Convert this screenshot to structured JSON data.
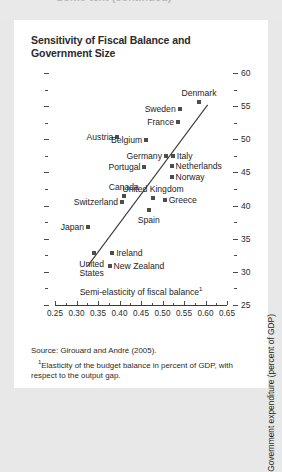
{
  "page": {
    "clipped_header_text": "Some text (continued)"
  },
  "figure": {
    "title": "Sensitivity of Fiscal Balance and Government Size",
    "source": "Source: Girouard and André (2005).",
    "footnote_marker": "1",
    "footnote": "Elasticity of the budget balance in percent of GDP, with respect to the output gap."
  },
  "chart_data": {
    "type": "scatter",
    "title": "Sensitivity of Fiscal Balance and Government Size",
    "xlabel": "Semi-elasticity of fiscal balance",
    "xlabel_footnote": "1",
    "ylabel": "Government expenditure (percent of GDP)",
    "xlim": [
      0.25,
      0.65
    ],
    "ylim": [
      25,
      60
    ],
    "xticks": [
      "0.25",
      "0.30",
      "0.35",
      "0.40",
      "0.45",
      "0.50",
      "0.55",
      "0.60",
      "0.65"
    ],
    "xtick_values": [
      0.25,
      0.3,
      0.35,
      0.4,
      0.45,
      0.5,
      0.55,
      0.6,
      0.65
    ],
    "yticks": [
      "25",
      "30",
      "35",
      "40",
      "45",
      "50",
      "55",
      "60"
    ],
    "ytick_values": [
      25,
      30,
      35,
      40,
      45,
      50,
      55,
      60
    ],
    "grid": false,
    "legend": null,
    "minor_ticks": true,
    "marker_color": "#4d4d4d",
    "trendline": {
      "label": "fitted line",
      "x0": 0.325,
      "y0": 30.8,
      "x1": 0.605,
      "y1": 55.2
    },
    "points": [
      {
        "label": "Denmark",
        "x": 0.585,
        "y": 55.6,
        "label_pos": "above"
      },
      {
        "label": "Sweden",
        "x": 0.54,
        "y": 54.6,
        "label_pos": "left"
      },
      {
        "label": "France",
        "x": 0.536,
        "y": 52.6,
        "label_pos": "left"
      },
      {
        "label": "Austria",
        "x": 0.395,
        "y": 50.3,
        "label_pos": "left"
      },
      {
        "label": "Belgium",
        "x": 0.462,
        "y": 49.9,
        "label_pos": "left"
      },
      {
        "label": "Germany",
        "x": 0.508,
        "y": 47.5,
        "label_pos": "left"
      },
      {
        "label": "Italy",
        "x": 0.524,
        "y": 47.5,
        "label_pos": "right"
      },
      {
        "label": "Netherlands",
        "x": 0.521,
        "y": 45.9,
        "label_pos": "right"
      },
      {
        "label": "Portugal",
        "x": 0.458,
        "y": 45.8,
        "label_pos": "left"
      },
      {
        "label": "Norway",
        "x": 0.521,
        "y": 44.3,
        "label_pos": "right"
      },
      {
        "label": "Canada",
        "x": 0.41,
        "y": 41.5,
        "label_pos": "above"
      },
      {
        "label": "United Kingdom",
        "x": 0.478,
        "y": 41.1,
        "label_pos": "above"
      },
      {
        "label": "Greece",
        "x": 0.505,
        "y": 40.9,
        "label_pos": "right"
      },
      {
        "label": "Switzerland",
        "x": 0.406,
        "y": 40.5,
        "label_pos": "left"
      },
      {
        "label": "Spain",
        "x": 0.468,
        "y": 39.4,
        "label_pos": "below"
      },
      {
        "label": "Japan",
        "x": 0.327,
        "y": 36.7,
        "label_pos": "left"
      },
      {
        "label": "United States",
        "x": 0.34,
        "y": 32.9,
        "label_pos": "two-line-below"
      },
      {
        "label": "Ireland",
        "x": 0.383,
        "y": 32.9,
        "label_pos": "right"
      },
      {
        "label": "New Zealand",
        "x": 0.377,
        "y": 30.9,
        "label_pos": "right"
      }
    ]
  }
}
